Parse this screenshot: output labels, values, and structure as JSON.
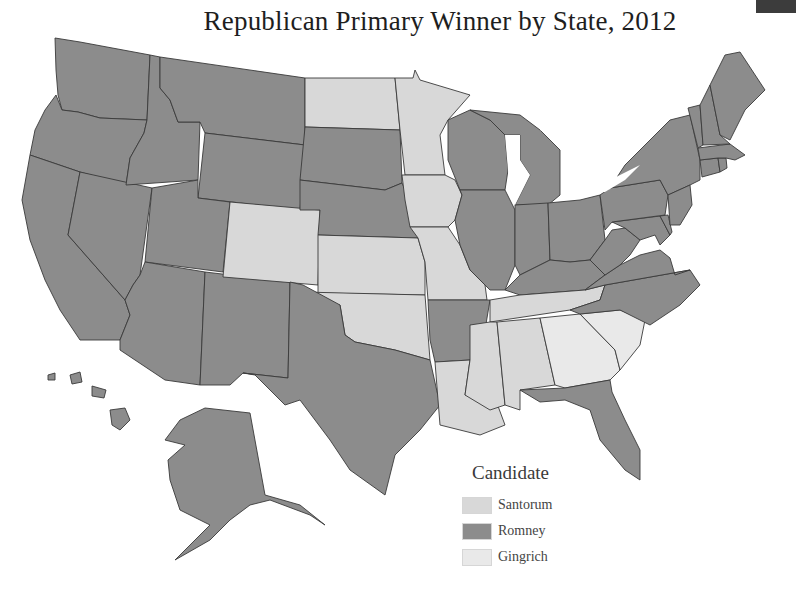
{
  "title": "Republican Primary Winner by State, 2012",
  "colors": {
    "Santorum": "#d8d8d8",
    "Romney": "#8c8c8c",
    "Gingrich": "#e9e9e9",
    "water": "#ffffff",
    "border": "#3a3a3a",
    "corner_badge": "#3c3c3c"
  },
  "legend": {
    "title": "Candidate",
    "items": [
      {
        "label": "Santorum",
        "key": "Santorum"
      },
      {
        "label": "Romney",
        "key": "Romney"
      },
      {
        "label": "Gingrich",
        "key": "Gingrich"
      }
    ]
  },
  "chart_data": {
    "type": "choropleth",
    "title": "Republican Primary Winner by State, 2012",
    "legend_title": "Candidate",
    "legend_position": "bottom-right",
    "categories": [
      "Santorum",
      "Romney",
      "Gingrich"
    ],
    "winners": {
      "WA": "Romney",
      "OR": "Romney",
      "CA": "Romney",
      "NV": "Romney",
      "ID": "Romney",
      "MT": "Romney",
      "WY": "Romney",
      "UT": "Romney",
      "AZ": "Romney",
      "NM": "Romney",
      "CO": "Santorum",
      "ND": "Santorum",
      "SD": "Romney",
      "NE": "Romney",
      "KS": "Santorum",
      "OK": "Santorum",
      "TX": "Romney",
      "MN": "Santorum",
      "IA": "Santorum",
      "MO": "Santorum",
      "AR": "Romney",
      "LA": "Santorum",
      "WI": "Romney",
      "IL": "Romney",
      "MI": "Romney",
      "IN": "Romney",
      "OH": "Romney",
      "KY": "Romney",
      "TN": "Santorum",
      "MS": "Santorum",
      "AL": "Santorum",
      "GA": "Gingrich",
      "SC": "Gingrich",
      "FL": "Romney",
      "NC": "Romney",
      "VA": "Romney",
      "WV": "Romney",
      "PA": "Romney",
      "NY": "Romney",
      "NJ": "Romney",
      "DE": "Romney",
      "MD": "Romney",
      "CT": "Romney",
      "RI": "Romney",
      "MA": "Romney",
      "VT": "Romney",
      "NH": "Romney",
      "ME": "Romney",
      "AK": "Romney",
      "HI": "Romney"
    }
  }
}
